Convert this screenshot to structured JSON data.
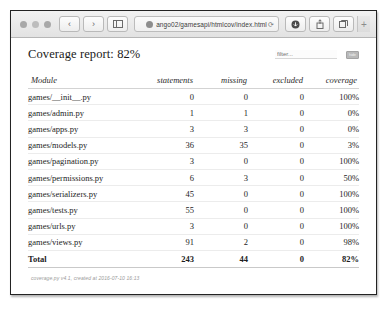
{
  "browser": {
    "url": "ango02/gamesapi/htmlcov/index.html",
    "favicon": "globe-icon",
    "reload_glyph": "⟳",
    "back_glyph": "‹",
    "forward_glyph": "›",
    "sidebar_glyph": "sidebar-icon",
    "download_glyph": "download-icon",
    "share_glyph": "share-icon",
    "tabs_glyph": "tabs-icon",
    "new_tab_glyph": "+"
  },
  "report": {
    "title": "Coverage report: 82%",
    "filter_placeholder": "filter...",
    "hotkey_badge": "hide"
  },
  "table": {
    "columns": [
      "Module",
      "statements",
      "missing",
      "excluded",
      "coverage"
    ],
    "rows": [
      {
        "module": "games/__init__.py",
        "statements": "0",
        "missing": "0",
        "excluded": "0",
        "coverage": "100%"
      },
      {
        "module": "games/admin.py",
        "statements": "1",
        "missing": "1",
        "excluded": "0",
        "coverage": "0%"
      },
      {
        "module": "games/apps.py",
        "statements": "3",
        "missing": "3",
        "excluded": "0",
        "coverage": "0%"
      },
      {
        "module": "games/models.py",
        "statements": "36",
        "missing": "35",
        "excluded": "0",
        "coverage": "3%"
      },
      {
        "module": "games/pagination.py",
        "statements": "3",
        "missing": "0",
        "excluded": "0",
        "coverage": "100%"
      },
      {
        "module": "games/permissions.py",
        "statements": "6",
        "missing": "3",
        "excluded": "0",
        "coverage": "50%"
      },
      {
        "module": "games/serializers.py",
        "statements": "45",
        "missing": "0",
        "excluded": "0",
        "coverage": "100%"
      },
      {
        "module": "games/tests.py",
        "statements": "55",
        "missing": "0",
        "excluded": "0",
        "coverage": "100%"
      },
      {
        "module": "games/urls.py",
        "statements": "3",
        "missing": "0",
        "excluded": "0",
        "coverage": "100%"
      },
      {
        "module": "games/views.py",
        "statements": "91",
        "missing": "2",
        "excluded": "0",
        "coverage": "98%"
      }
    ],
    "total": {
      "module": "Total",
      "statements": "243",
      "missing": "44",
      "excluded": "0",
      "coverage": "82%"
    }
  },
  "footer": {
    "note": "coverage.py v4.1, created at 2016-07-10 16:13"
  }
}
